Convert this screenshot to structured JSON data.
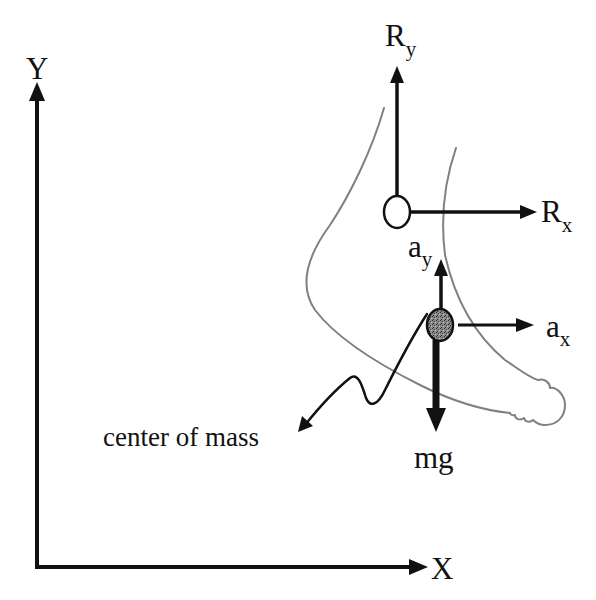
{
  "diagram": {
    "kind": "free-body diagram of foot",
    "axes": {
      "y_label": "Y",
      "x_label": "X"
    },
    "forces": {
      "reaction_y": {
        "base": "R",
        "sub": "y"
      },
      "reaction_x": {
        "base": "R",
        "sub": "x"
      },
      "weight": {
        "label": "mg"
      }
    },
    "accelerations": {
      "accel_y": {
        "base": "a",
        "sub": "y"
      },
      "accel_x": {
        "base": "a",
        "sub": "x"
      }
    },
    "callout": {
      "label": "center of mass"
    },
    "colors": {
      "ink": "#111111",
      "outline": "#808080",
      "center_of_mass_fill": "#6e6e6e",
      "joint_fill": "#ffffff",
      "background": "#ffffff"
    }
  }
}
